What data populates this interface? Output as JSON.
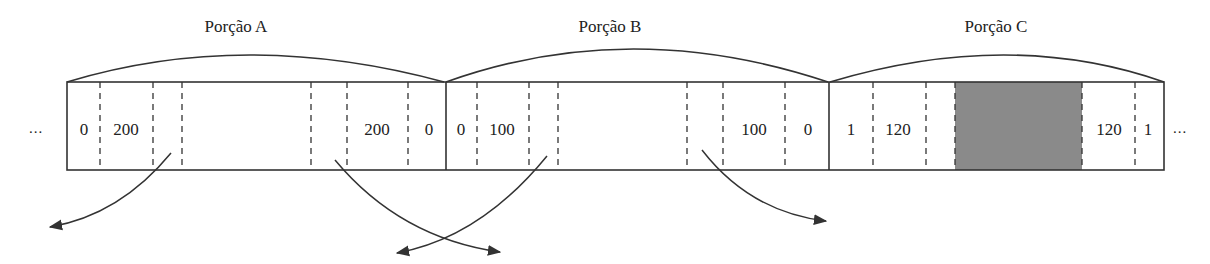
{
  "diagram": {
    "type": "array-partition",
    "ellipsis_left": "...",
    "ellipsis_right": "...",
    "colors": {
      "stroke": "#333333",
      "shade": "#8a8a8a",
      "text": "#222222",
      "background": "#ffffff"
    },
    "portions": [
      {
        "title": "Porção A",
        "cells": [
          {
            "value": "0"
          },
          {
            "value": "200"
          },
          {
            "value": ""
          },
          {
            "value": ""
          },
          {
            "value": ""
          },
          {
            "value": "200"
          },
          {
            "value": "0"
          }
        ]
      },
      {
        "title": "Porção B",
        "cells": [
          {
            "value": "0"
          },
          {
            "value": "100"
          },
          {
            "value": ""
          },
          {
            "value": ""
          },
          {
            "value": ""
          },
          {
            "value": "100"
          },
          {
            "value": "0"
          }
        ]
      },
      {
        "title": "Porção C",
        "cells": [
          {
            "value": "1"
          },
          {
            "value": "120"
          },
          {
            "value": ""
          },
          {
            "value": "shaded"
          },
          {
            "value": "120"
          },
          {
            "value": "1"
          }
        ]
      }
    ],
    "arrows": [
      {
        "from": "Porção A left-inner",
        "direction": "down-left"
      },
      {
        "from": "Porção A right-inner",
        "direction": "down-right"
      },
      {
        "from": "Porção B left-inner",
        "direction": "down-left"
      },
      {
        "from": "Porção B right-inner",
        "direction": "down-right"
      }
    ]
  }
}
